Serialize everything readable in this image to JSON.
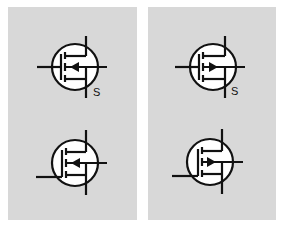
{
  "figure": {
    "panels": [
      {
        "id": "left",
        "description": "N-channel MOSFET symbols",
        "symbols": [
          {
            "position": "top",
            "channel": "n",
            "arrow": "inward",
            "gate_entry": "center",
            "label": "S"
          },
          {
            "position": "bottom",
            "channel": "n",
            "arrow": "inward",
            "gate_entry": "bottom",
            "label": ""
          }
        ]
      },
      {
        "id": "right",
        "description": "P-channel MOSFET symbols",
        "symbols": [
          {
            "position": "top",
            "channel": "p",
            "arrow": "outward",
            "gate_entry": "center",
            "label": "S"
          },
          {
            "position": "bottom",
            "channel": "p",
            "arrow": "outward",
            "gate_entry": "bottom",
            "label": ""
          }
        ]
      }
    ],
    "colors": {
      "panel_background": "#d8d8d8",
      "page_background": "#ffffff",
      "line": "#111111",
      "circle_fill": "#ffffff"
    }
  }
}
